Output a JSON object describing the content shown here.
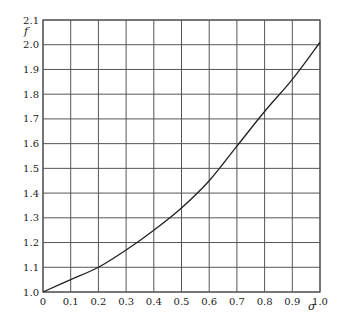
{
  "header_fragment": "…函数 f 与σ 的关系 …",
  "chart_data": {
    "type": "line",
    "title": "",
    "xlabel": "σ",
    "ylabel": "f",
    "xlim": [
      0,
      1.0
    ],
    "ylim": [
      1.0,
      2.1
    ],
    "grid": true,
    "x_ticks": [
      "0",
      "0.1",
      "0.2",
      "0.3",
      "0.4",
      "0.5",
      "0.6",
      "0.7",
      "0.8",
      "0.9",
      "1.0"
    ],
    "y_ticks": [
      "1.0",
      "1.1",
      "1.2",
      "1.3",
      "1.4",
      "1.5",
      "1.6",
      "1.7",
      "1.8",
      "1.9",
      "2.0",
      "2.1"
    ],
    "series": [
      {
        "name": "f(σ)",
        "x": [
          0,
          0.1,
          0.2,
          0.3,
          0.4,
          0.5,
          0.6,
          0.7,
          0.8,
          0.9,
          1.0
        ],
        "values": [
          1.0,
          1.05,
          1.1,
          1.17,
          1.25,
          1.34,
          1.45,
          1.59,
          1.73,
          1.86,
          2.01
        ]
      }
    ],
    "colors": {
      "grid": "#555555",
      "line": "#222222",
      "frame": "#555555"
    }
  }
}
